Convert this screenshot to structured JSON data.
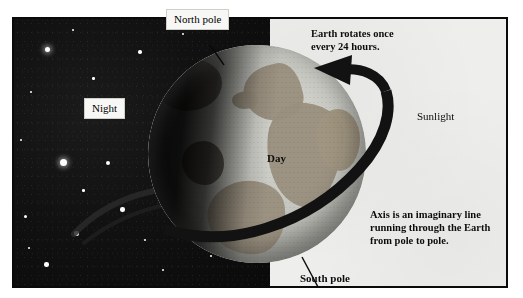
{
  "figure": {
    "frame": {
      "border_color": "#0a0a0a"
    }
  },
  "regions": {
    "night_label": "Night",
    "day_label": "Day",
    "sunlight_label": "Sunlight",
    "night_bg_color": "#0d0d0d",
    "sunlight_bg_color": "#eeeeec"
  },
  "callouts": [
    {
      "id": "north-pole",
      "text": "North pole",
      "boxed": true
    },
    {
      "id": "night",
      "text": "Night",
      "boxed": true
    },
    {
      "id": "south-pole",
      "text": "South pole",
      "boxed": false
    }
  ],
  "notes": {
    "rotation": "Earth rotates once\nevery 24 hours.",
    "rotation_line1": "Earth rotates once",
    "rotation_line2": "every 24 hours.",
    "axis": "Axis is an imaginary line\nrunning through the Earth\nfrom pole to pole.",
    "axis_line1": "Axis is an imaginary line",
    "axis_line2": "running through the Earth",
    "axis_line3": "from pole to pole."
  },
  "globe": {
    "land_color": "#9a8f7e",
    "ocean_color": "#c6c6c0",
    "shadow_color": "#000000",
    "visible_landmasses": [
      "Europe",
      "Africa",
      "South America",
      "North America",
      "Asia"
    ]
  },
  "arrow": {
    "name": "rotation-direction-arrow",
    "color": "#111111",
    "direction": "west-to-east"
  },
  "stars": {
    "count": 22,
    "color": "#fdfdfd"
  }
}
